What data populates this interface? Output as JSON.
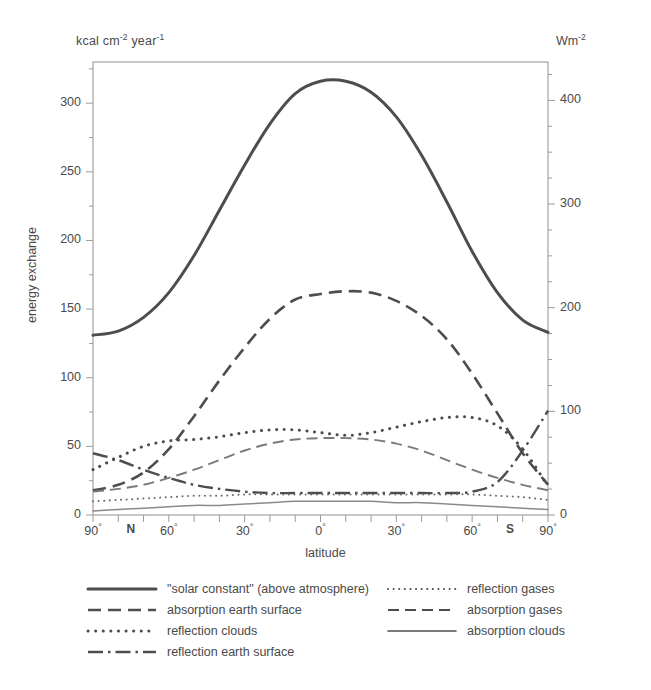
{
  "chart_data": {
    "type": "line",
    "title": "",
    "xlabel": "latitude",
    "ylabel": "energy exchange",
    "unit_left": "kcal cm-2 year-1",
    "unit_right": "Wm-2",
    "grid": false,
    "legend_position": "bottom",
    "xlim": [
      -90,
      90
    ],
    "ylim": [
      0,
      330
    ],
    "y2lim": [
      0,
      437
    ],
    "yticks": [
      0,
      50,
      100,
      150,
      200,
      250,
      300
    ],
    "ytick_labels": [
      "0",
      "50",
      "100",
      "150",
      "200",
      "250",
      "300"
    ],
    "yminor_step": 25,
    "y2ticks": [
      0,
      100,
      200,
      300,
      400
    ],
    "y2tick_labels": [
      "0",
      "100",
      "200",
      "300",
      "400"
    ],
    "y2minor_step": 25,
    "xticks": [
      -90,
      -80,
      -70,
      -60,
      -50,
      -40,
      -30,
      -20,
      -10,
      0,
      10,
      20,
      30,
      40,
      50,
      60,
      70,
      80,
      90
    ],
    "xtick_labels": [
      {
        "x": -90,
        "text": "90",
        "deg": true,
        "bold": false
      },
      {
        "x": -75,
        "text": "N",
        "deg": false,
        "bold": true
      },
      {
        "x": -60,
        "text": "60",
        "deg": true,
        "bold": false
      },
      {
        "x": -30,
        "text": "30",
        "deg": true,
        "bold": false
      },
      {
        "x": 0,
        "text": "0",
        "deg": true,
        "bold": false
      },
      {
        "x": 30,
        "text": "30",
        "deg": true,
        "bold": false
      },
      {
        "x": 60,
        "text": "60",
        "deg": true,
        "bold": false
      },
      {
        "x": 75,
        "text": "S",
        "deg": false,
        "bold": true
      },
      {
        "x": 90,
        "text": "90",
        "deg": true,
        "bold": false
      }
    ],
    "x": [
      -90,
      -80,
      -70,
      -60,
      -50,
      -40,
      -30,
      -20,
      -10,
      0,
      10,
      20,
      30,
      40,
      50,
      60,
      70,
      80,
      90
    ],
    "series": [
      {
        "name": "\"solar constant\" (above atmosphere)",
        "style": "solid-thick",
        "color": "#4d4d4d",
        "values": [
          131,
          134,
          144,
          162,
          189,
          222,
          255,
          285,
          307,
          316,
          316,
          308,
          290,
          262,
          228,
          192,
          162,
          142,
          133
        ]
      },
      {
        "name": "absorption earth surface",
        "style": "dashed",
        "color": "#4d4d4d",
        "values": [
          18,
          22,
          31,
          48,
          72,
          98,
          122,
          143,
          157,
          161,
          163,
          162,
          156,
          145,
          128,
          103,
          74,
          45,
          22
        ]
      },
      {
        "name": "reflection clouds",
        "style": "dotted-bold",
        "color": "#4d4d4d",
        "values": [
          33,
          42,
          50,
          54,
          55,
          57,
          60,
          62,
          62,
          60,
          58,
          60,
          64,
          68,
          71,
          71,
          65,
          48,
          21
        ]
      },
      {
        "name": "reflection earth surface",
        "style": "dash-dot",
        "color": "#4d4d4d",
        "values": [
          45,
          40,
          33,
          27,
          22,
          19,
          17,
          16,
          16,
          16,
          16,
          16,
          16,
          16,
          16,
          17,
          24,
          47,
          76
        ]
      },
      {
        "name": "reflection gases",
        "style": "dotted-fine",
        "color": "#6e6e6e",
        "values": [
          10,
          11,
          12,
          13,
          14,
          14,
          15,
          15,
          15,
          15,
          15,
          15,
          15,
          15,
          15,
          15,
          14,
          13,
          11
        ]
      },
      {
        "name": "absorption gases",
        "style": "dashed-thin",
        "color": "#7a7a7a",
        "values": [
          17,
          19,
          22,
          27,
          33,
          40,
          47,
          52,
          55,
          56,
          56,
          55,
          52,
          47,
          40,
          33,
          27,
          22,
          18
        ]
      },
      {
        "name": "absorption clouds",
        "style": "solid-thin",
        "color": "#8a8a8a",
        "values": [
          3,
          4,
          5,
          6,
          7,
          7,
          8,
          9,
          10,
          10,
          10,
          10,
          9,
          9,
          8,
          7,
          6,
          5,
          4
        ]
      }
    ],
    "legend": [
      {
        "label": "\"solar constant\" (above atmosphere)",
        "style": "solid-thick",
        "column": "left"
      },
      {
        "label": "absorption earth surface",
        "style": "dashed",
        "column": "left"
      },
      {
        "label": "reflection clouds",
        "style": "dotted-bold",
        "column": "left"
      },
      {
        "label": "reflection earth surface",
        "style": "dash-dot",
        "column": "left"
      },
      {
        "label": "reflection gases",
        "style": "dotted-fine",
        "column": "right"
      },
      {
        "label": "absorption gases",
        "style": "dashed-thin",
        "column": "right"
      },
      {
        "label": "absorption clouds",
        "style": "solid-thin",
        "column": "right"
      }
    ]
  }
}
